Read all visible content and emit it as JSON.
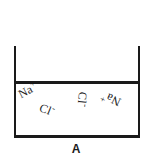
{
  "figure": {
    "caption": "A",
    "container": {
      "name": "beaker",
      "line_color": "#1a1a1a",
      "fill_color": "#ffffff"
    },
    "ions": [
      {
        "id": "na-left",
        "label": "Na",
        "charge": "+",
        "rotation_deg": -28
      },
      {
        "id": "cl-left",
        "label": "Cl",
        "charge": "-",
        "rotation_deg": 22
      },
      {
        "id": "cl-right",
        "label": "Cl",
        "charge": "-",
        "rotation_deg": 96
      },
      {
        "id": "na-right",
        "label": "Na",
        "charge": "+",
        "rotation_deg": 205
      }
    ]
  },
  "colors": {
    "background": "#ffffff",
    "ink": "#1a1a1a"
  }
}
